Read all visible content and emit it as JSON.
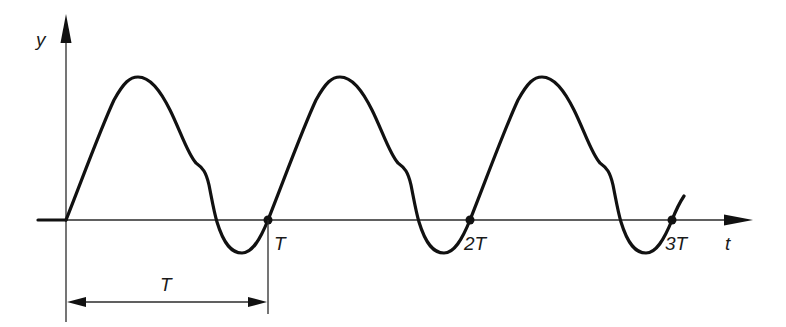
{
  "diagram": {
    "axes": {
      "y_label": "y",
      "x_label": "t"
    },
    "period_markers": [
      {
        "label": "T",
        "x": 268
      },
      {
        "label": "2T",
        "x": 470
      },
      {
        "label": "3T",
        "x": 672
      }
    ],
    "dimension": {
      "label": "T",
      "from": "0",
      "to": "T"
    },
    "colors": {
      "line": "#111111",
      "background": "#ffffff"
    }
  }
}
